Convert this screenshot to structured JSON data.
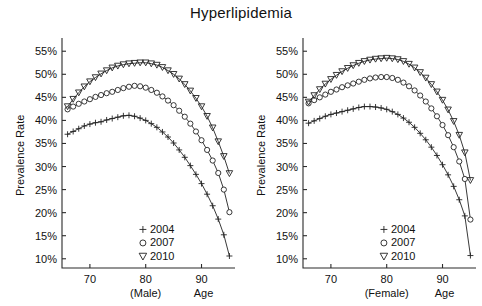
{
  "figure": {
    "title": "Hyperlipidemia",
    "panel_count": 2
  },
  "axes": {
    "ylabel": "Prevalence Rate",
    "xlabel": "Age",
    "y_ticks": [
      "10%",
      "15%",
      "20%",
      "25%",
      "30%",
      "35%",
      "40%",
      "45%",
      "50%",
      "55%"
    ],
    "x_ticks": [
      "70",
      "80",
      "90"
    ],
    "group_male": "(Male)",
    "group_female": "(Female)"
  },
  "legend": {
    "entries": [
      {
        "label": "2004",
        "marker": "plus-marker"
      },
      {
        "label": "2007",
        "marker": "circle-marker"
      },
      {
        "label": "2010",
        "marker": "triangle-down-marker"
      }
    ]
  },
  "chart_data": [
    {
      "type": "line",
      "title": "Hyperlipidemia",
      "panel": "(Male)",
      "xlabel": "Age",
      "ylabel": "Prevalence Rate",
      "xlim": [
        65,
        96
      ],
      "ylim": [
        8,
        57
      ],
      "ytick_values": [
        10,
        15,
        20,
        25,
        30,
        35,
        40,
        45,
        50,
        55
      ],
      "ytick_labels": [
        "10%",
        "15%",
        "20%",
        "25%",
        "30%",
        "35%",
        "40%",
        "45%",
        "50%",
        "55%"
      ],
      "xtick_values": [
        70,
        80,
        90
      ],
      "xtick_labels": [
        "70",
        "80",
        "90"
      ],
      "grid": false,
      "legend_position": "lower-center-inside",
      "x": [
        66,
        67,
        68,
        69,
        70,
        71,
        72,
        73,
        74,
        75,
        76,
        77,
        78,
        79,
        80,
        81,
        82,
        83,
        84,
        85,
        86,
        87,
        88,
        89,
        90,
        91,
        92,
        93,
        94,
        95
      ],
      "series": [
        {
          "name": "2004",
          "marker": "plus-marker",
          "values": [
            37.0,
            37.6,
            38.2,
            38.8,
            39.2,
            39.5,
            39.7,
            40.1,
            40.4,
            40.7,
            41.0,
            41.1,
            40.9,
            40.5,
            40.0,
            39.3,
            38.5,
            37.5,
            36.4,
            35.1,
            33.6,
            32.0,
            30.2,
            28.3,
            26.3,
            24.0,
            21.5,
            18.6,
            15.2,
            10.6
          ]
        },
        {
          "name": "2007",
          "marker": "circle-marker",
          "values": [
            42.4,
            43.0,
            43.6,
            44.1,
            44.6,
            45.1,
            45.5,
            45.9,
            46.2,
            46.6,
            47.0,
            47.3,
            47.5,
            47.4,
            47.1,
            46.6,
            46.0,
            45.2,
            44.3,
            43.3,
            42.1,
            40.8,
            39.3,
            37.6,
            35.7,
            33.6,
            31.3,
            28.6,
            25.0,
            20.1
          ]
        },
        {
          "name": "2010",
          "marker": "triangle-down-marker",
          "values": [
            43.0,
            44.6,
            46.0,
            47.3,
            48.4,
            49.3,
            50.1,
            50.8,
            51.4,
            51.8,
            52.1,
            52.3,
            52.4,
            52.5,
            52.5,
            52.3,
            52.0,
            51.5,
            50.8,
            50.0,
            49.0,
            47.8,
            46.4,
            44.8,
            43.0,
            40.9,
            38.4,
            35.4,
            32.2,
            28.5
          ]
        }
      ]
    },
    {
      "type": "line",
      "title": "Hyperlipidemia",
      "panel": "(Female)",
      "xlabel": "Age",
      "ylabel": "Prevalence Rate",
      "xlim": [
        65,
        96
      ],
      "ylim": [
        8,
        57
      ],
      "ytick_values": [
        10,
        15,
        20,
        25,
        30,
        35,
        40,
        45,
        50,
        55
      ],
      "ytick_labels": [
        "10%",
        "15%",
        "20%",
        "25%",
        "30%",
        "35%",
        "40%",
        "45%",
        "50%",
        "55%"
      ],
      "xtick_values": [
        70,
        80,
        90
      ],
      "xtick_labels": [
        "70",
        "80",
        "90"
      ],
      "grid": false,
      "legend_position": "lower-center-inside",
      "x": [
        66,
        67,
        68,
        69,
        70,
        71,
        72,
        73,
        74,
        75,
        76,
        77,
        78,
        79,
        80,
        81,
        82,
        83,
        84,
        85,
        86,
        87,
        88,
        89,
        90,
        91,
        92,
        93,
        94,
        95
      ],
      "series": [
        {
          "name": "2004",
          "marker": "plus-marker",
          "values": [
            39.4,
            39.9,
            40.4,
            40.9,
            41.3,
            41.6,
            41.9,
            42.2,
            42.5,
            42.8,
            43.0,
            43.0,
            42.9,
            42.7,
            42.4,
            41.9,
            41.3,
            40.5,
            39.6,
            38.5,
            37.2,
            35.8,
            34.2,
            32.4,
            30.4,
            28.2,
            25.7,
            22.8,
            19.3,
            10.7
          ]
        },
        {
          "name": "2007",
          "marker": "circle-marker",
          "values": [
            43.7,
            44.4,
            45.0,
            45.6,
            46.2,
            46.7,
            47.2,
            47.6,
            48.0,
            48.4,
            48.8,
            49.1,
            49.3,
            49.4,
            49.4,
            49.2,
            48.8,
            48.2,
            47.4,
            46.5,
            45.4,
            44.1,
            42.6,
            40.9,
            39.0,
            36.8,
            34.2,
            31.1,
            27.3,
            18.5
          ]
        },
        {
          "name": "2010",
          "marker": "triangle-down-marker",
          "values": [
            44.0,
            45.4,
            46.7,
            47.9,
            48.9,
            49.8,
            50.6,
            51.3,
            51.9,
            52.4,
            52.8,
            53.1,
            53.3,
            53.4,
            53.5,
            53.4,
            53.2,
            52.8,
            52.2,
            51.4,
            50.4,
            49.2,
            47.8,
            46.2,
            44.4,
            42.3,
            39.8,
            36.8,
            33.0,
            27.0
          ]
        }
      ]
    }
  ]
}
